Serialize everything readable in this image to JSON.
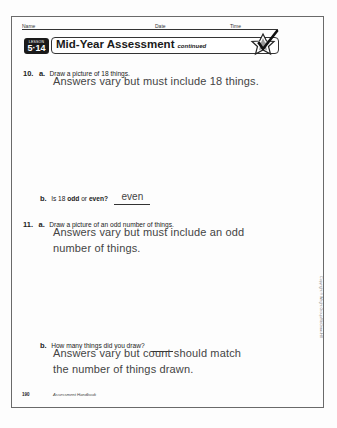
{
  "header": {
    "name_label": "Name",
    "date_label": "Date",
    "time_label": "Time"
  },
  "lesson": {
    "badge_label": "LESSON",
    "badge_number": "5·14",
    "title": "Mid-Year Assessment",
    "title_suffix": "continued",
    "icon": "star-check-icon"
  },
  "questions": [
    {
      "number": "10.",
      "parts": [
        {
          "letter": "a.",
          "prompt": "Draw a picture of 18 things.",
          "answer_lines": [
            "Answers vary but must include 18 things."
          ]
        },
        {
          "letter": "b.",
          "prompt_parts": [
            "Is 18 ",
            "odd",
            " or ",
            "even?"
          ],
          "inline_answer": "even"
        }
      ]
    },
    {
      "number": "11.",
      "parts": [
        {
          "letter": "a.",
          "prompt": "Draw a picture of an odd number of things.",
          "answer_lines": [
            "Answers vary but must include an odd",
            "number of things."
          ]
        },
        {
          "letter": "b.",
          "prompt": "How many things did you draw?",
          "answer_lines": [
            "Answers vary but count should match",
            "the number of things drawn."
          ]
        }
      ]
    }
  ],
  "footer": {
    "page_number": "190",
    "book_title": "Assessment Handbook"
  },
  "copyright": "Copyright © Wright Group/McGraw-Hill"
}
